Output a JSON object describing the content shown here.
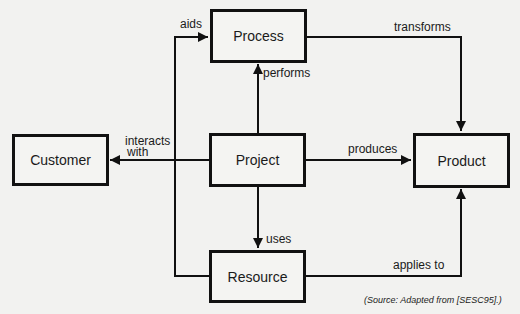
{
  "diagram": {
    "nodes": {
      "process": "Process",
      "customer": "Customer",
      "project": "Project",
      "product": "Product",
      "resource": "Resource"
    },
    "edges": {
      "aids": "aids",
      "transforms": "transforms",
      "performs": "performs",
      "interacts_with_line1": "interacts",
      "interacts_with_line2": "with",
      "produces": "produces",
      "uses": "uses",
      "applies_to": "applies to"
    },
    "relationships": [
      {
        "from": "Resource",
        "to": "Process",
        "label": "aids"
      },
      {
        "from": "Process",
        "to": "Product",
        "label": "transforms"
      },
      {
        "from": "Project",
        "to": "Process",
        "label": "performs"
      },
      {
        "from": "Project",
        "to": "Customer",
        "label": "interacts with"
      },
      {
        "from": "Project",
        "to": "Product",
        "label": "produces"
      },
      {
        "from": "Project",
        "to": "Resource",
        "label": "uses"
      },
      {
        "from": "Resource",
        "to": "Product",
        "label": "applies to"
      }
    ],
    "source": "(Source: Adapted from [SESC95].)"
  }
}
